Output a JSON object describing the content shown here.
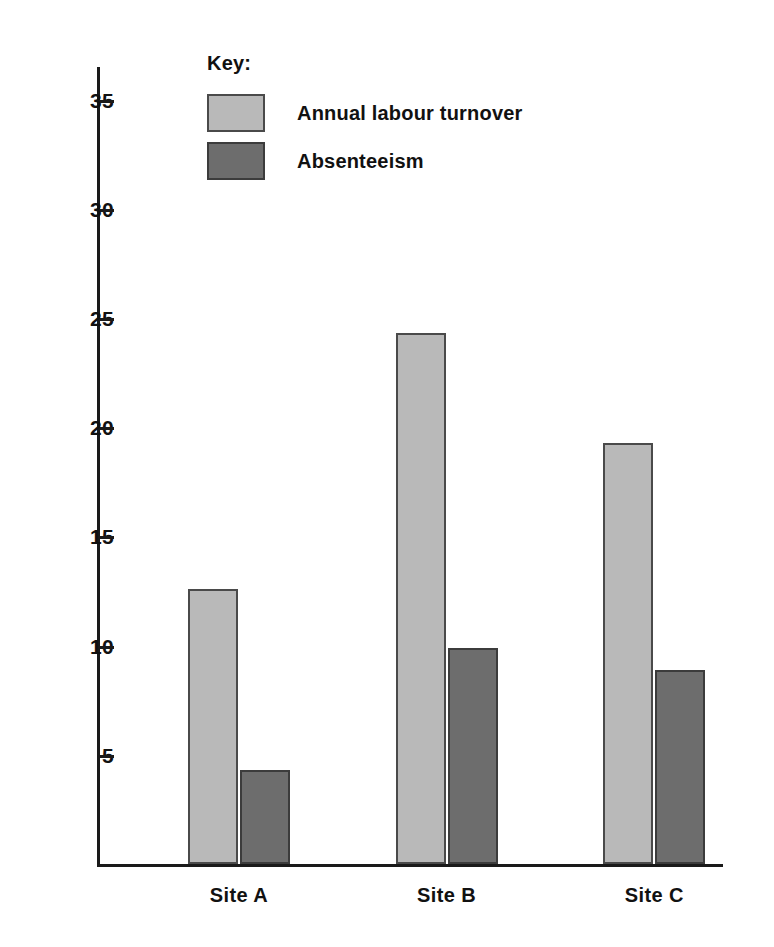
{
  "chart_data": {
    "type": "bar",
    "title": "",
    "xlabel": "",
    "ylabel": "",
    "categories": [
      "Site A",
      "Site B",
      "Site C"
    ],
    "series": [
      {
        "name": "Annual labour turnover",
        "color": "#b9b9b9",
        "values": [
          12.6,
          24.3,
          19.3
        ]
      },
      {
        "name": "Absenteeism",
        "color": "#6d6d6d",
        "values": [
          4.3,
          9.9,
          8.9
        ]
      }
    ],
    "ylim": [
      0,
      36.5
    ],
    "yticks": [
      5,
      10,
      15,
      20,
      25,
      30,
      35
    ],
    "ytick_labels": [
      "5",
      "10",
      "15",
      "20",
      "25",
      "30",
      "35"
    ],
    "grid": false,
    "legend_position": "top-left-inside",
    "legend_title": "Key:"
  },
  "legend": {
    "title": "Key:",
    "entries": [
      {
        "label": "Annual labour turnover"
      },
      {
        "label": "Absenteeism"
      }
    ]
  },
  "axis": {
    "y_labels": [
      "35",
      "30",
      "25",
      "20",
      "15",
      "10",
      "5"
    ],
    "x_labels": [
      "Site A",
      "Site B",
      "Site C"
    ]
  }
}
